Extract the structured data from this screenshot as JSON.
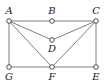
{
  "diagram": {
    "nodes": [
      {
        "id": "A",
        "label": "A",
        "x": 9,
        "y": 21,
        "lx": 9,
        "ly": 14
      },
      {
        "id": "B",
        "label": "B",
        "x": 52,
        "y": 21,
        "lx": 52,
        "ly": 14
      },
      {
        "id": "C",
        "label": "C",
        "x": 96,
        "y": 21,
        "lx": 96,
        "ly": 14
      },
      {
        "id": "D",
        "label": "D",
        "x": 52,
        "y": 40,
        "lx": 52,
        "ly": 52
      },
      {
        "id": "G",
        "label": "G",
        "x": 9,
        "y": 67,
        "lx": 9,
        "ly": 80
      },
      {
        "id": "F",
        "label": "F",
        "x": 52,
        "y": 67,
        "lx": 52,
        "ly": 80
      },
      {
        "id": "E",
        "label": "E",
        "x": 96,
        "y": 67,
        "lx": 96,
        "ly": 80
      }
    ],
    "edges": [
      [
        "A",
        "B"
      ],
      [
        "B",
        "C"
      ],
      [
        "A",
        "G"
      ],
      [
        "C",
        "E"
      ],
      [
        "G",
        "F"
      ],
      [
        "F",
        "E"
      ],
      [
        "A",
        "D"
      ],
      [
        "D",
        "C"
      ],
      [
        "A",
        "F"
      ],
      [
        "F",
        "C"
      ]
    ],
    "colors": {
      "edge": "#6f6f6f",
      "node_stroke": "#3a3a3a",
      "label": "#222222"
    }
  }
}
